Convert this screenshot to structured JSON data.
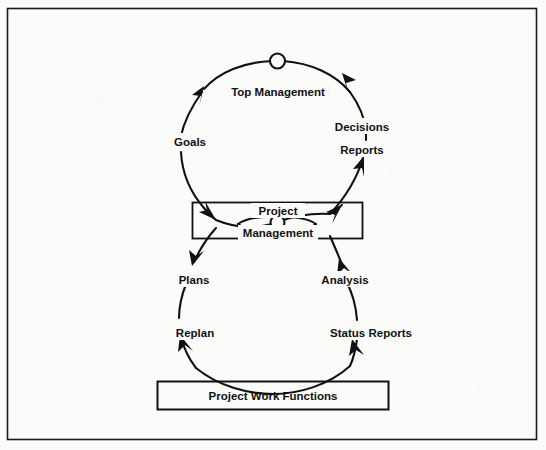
{
  "figure": {
    "kind": "project-management-control-loop-diagram",
    "background_color": "#fbfbfa",
    "ink_color": "#111111",
    "frame": {
      "stroke": "#1a1a1a",
      "x": 7,
      "y": 8,
      "width": 530,
      "height": 432
    }
  },
  "boxes": {
    "project_management": {
      "line1": "Project",
      "line2": "Management",
      "x": 192,
      "y": 202,
      "width": 171,
      "height": 36
    },
    "project_work_functions": {
      "label": "Project Work Functions",
      "x": 157,
      "y": 381,
      "width": 232,
      "height": 29
    }
  },
  "loops": {
    "upper": {
      "name": "top-management-loop",
      "center_label": "Top Management",
      "node_marker": "circle",
      "left_labels": [
        "Goals"
      ],
      "right_labels": [
        "Decisions",
        "Reports"
      ]
    },
    "lower": {
      "name": "project-work-loop",
      "node_marker": "circle",
      "left_labels": [
        "Plans",
        "Replan"
      ],
      "right_labels": [
        "Analysis",
        "Status Reports"
      ]
    }
  },
  "labels": {
    "top_management": "Top Management",
    "goals": "Goals",
    "decisions": "Decisions",
    "reports": "Reports",
    "project": "Project",
    "management": "Management",
    "plans": "Plans",
    "analysis": "Analysis",
    "replan": "Replan",
    "status_reports": "Status Reports",
    "project_work_functions": "Project Work Functions"
  }
}
